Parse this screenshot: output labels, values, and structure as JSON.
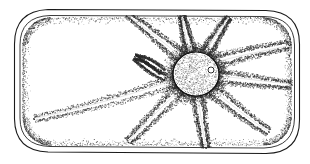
{
  "figure": {
    "title": "Plant cell with central nucleus and cytoplasmic strands",
    "caption": "",
    "background_color": "#ffffff",
    "ink_color": "#1a1a1a",
    "stipple_color": "#2b2b2b",
    "width": 310,
    "height": 164
  },
  "structures": {
    "cell_wall": {
      "label": "cell wall",
      "shape": "rounded-rectangle",
      "stroke_color": "#1a1a1a",
      "bounds": {
        "x": 14,
        "y": 9,
        "width": 286,
        "height": 146
      },
      "corner_radius": 34
    },
    "plasma_membrane": {
      "label": "plasma membrane",
      "shape": "rounded-rectangle",
      "stroke_color": "#242424",
      "bounds": {
        "x": 20,
        "y": 15,
        "width": 274,
        "height": 134
      },
      "corner_radius": 30
    },
    "nucleus": {
      "label": "nucleus",
      "shape": "ellipse",
      "center": {
        "x": 196,
        "y": 74
      },
      "radius_x": 23,
      "radius_y": 22,
      "fill": "stippled",
      "stroke_color": "#111111"
    },
    "nucleolus": {
      "label": "nucleolus",
      "shape": "circle",
      "center": {
        "x": 211,
        "y": 70
      },
      "radius": 3,
      "stroke_color": "#111111"
    },
    "vacuoles": {
      "label": "vacuoles",
      "count": 9,
      "fill": "clear"
    },
    "cytoplasmic_strands": {
      "label": "cytoplasmic strands",
      "count": 9,
      "rendering": "stippled",
      "endpoints": [
        {
          "name": "strand-up-left",
          "to": {
            "x": 128,
            "y": 14
          }
        },
        {
          "name": "strand-up",
          "to": {
            "x": 182,
            "y": 16
          }
        },
        {
          "name": "strand-up-right",
          "to": {
            "x": 228,
            "y": 18
          }
        },
        {
          "name": "strand-right-upper",
          "to": {
            "x": 286,
            "y": 46
          }
        },
        {
          "name": "strand-right",
          "to": {
            "x": 290,
            "y": 84
          }
        },
        {
          "name": "strand-right-lower",
          "to": {
            "x": 268,
            "y": 130
          }
        },
        {
          "name": "strand-down",
          "to": {
            "x": 206,
            "y": 146
          }
        },
        {
          "name": "strand-down-left",
          "to": {
            "x": 128,
            "y": 140
          }
        },
        {
          "name": "strand-left",
          "to": {
            "x": 36,
            "y": 118
          }
        }
      ]
    }
  }
}
